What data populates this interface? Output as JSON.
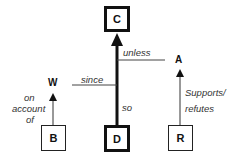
{
  "diagram": {
    "type": "Toulmin argument model",
    "nodes": {
      "claim": "C",
      "data": "D",
      "warrant": "W",
      "backing": "B",
      "rebuttal": "A",
      "rebuttal_support": "R"
    },
    "labels": {
      "unless": "unless",
      "since": "since",
      "so": "so",
      "on_account_of": [
        "on",
        "account",
        "of"
      ],
      "supports_refutes": [
        "Supports/",
        "refutes"
      ]
    }
  }
}
